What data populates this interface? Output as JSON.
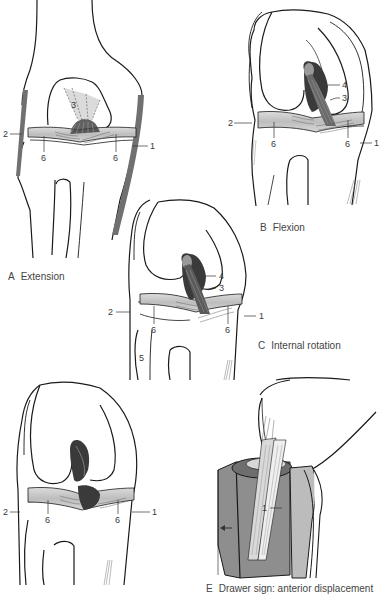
{
  "figure": {
    "panels": [
      {
        "id": "A",
        "letter": "A",
        "title": "Extension",
        "labels": {
          "l1": "1",
          "l2": "2",
          "l3": "3",
          "l6a": "6",
          "l6b": "6"
        }
      },
      {
        "id": "B",
        "letter": "B",
        "title": "Flexion",
        "labels": {
          "l1": "1",
          "l2": "2",
          "l3": "3",
          "l4": "4",
          "l6a": "6",
          "l6b": "6"
        }
      },
      {
        "id": "C",
        "letter": "C",
        "title": "Internal rotation",
        "labels": {
          "l1": "1",
          "l2": "2",
          "l3": "3",
          "l4": "4",
          "l5": "5",
          "l6a": "6",
          "l6b": "6"
        }
      },
      {
        "id": "D",
        "letter": "",
        "title": "",
        "labels": {
          "l1": "1",
          "l2": "2",
          "l6a": "6",
          "l6b": "6"
        }
      },
      {
        "id": "E",
        "letter": "E",
        "title": "Drawer sign: anterior displacement",
        "labels": {
          "l1": "1"
        }
      }
    ]
  },
  "colors": {
    "outline": "#1a1a1a",
    "meniscus": "#c9c9c9",
    "ligament_dark": "#4a4a4a",
    "ligament_gray": "#9a9a9a",
    "collateral": "#6e6e6e",
    "tibia_shade": "#8c8c8c"
  }
}
